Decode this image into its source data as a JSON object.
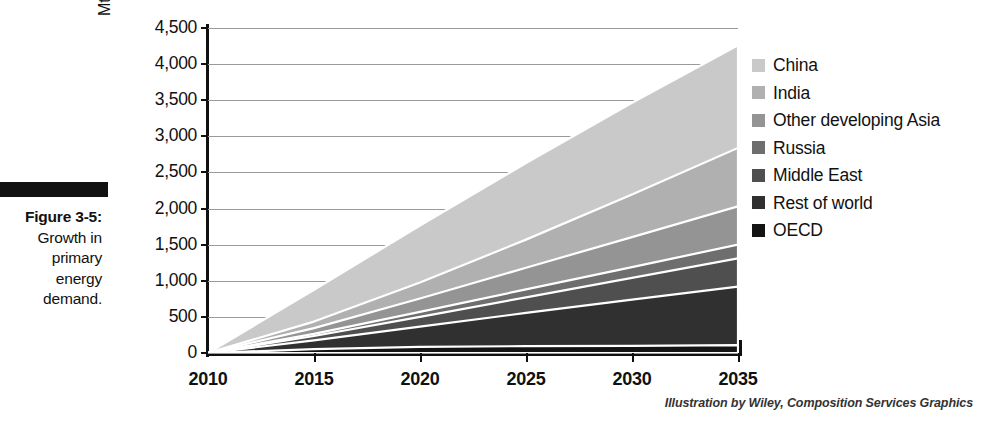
{
  "figure": {
    "number_label": "Figure 3-5:",
    "caption": "Growth in primary energy demand.",
    "caption_lines": [
      "Growth in",
      "primary",
      "energy",
      "demand."
    ],
    "credit": "Illustration by Wiley, Composition Services Graphics"
  },
  "chart_data": {
    "type": "area",
    "stacked": true,
    "title": "Growth in primary energy demand",
    "xlabel": "",
    "ylabel": "Mtoe",
    "y_axis_unit": "Mtoe",
    "x": [
      2010,
      2015,
      2020,
      2025,
      2030,
      2035
    ],
    "x_tick_labels": [
      "2010",
      "2015",
      "2020",
      "2025",
      "2030",
      "2035"
    ],
    "xlim": [
      2010,
      2035
    ],
    "ylim": [
      0,
      4500
    ],
    "y_tick_labels": [
      "0",
      "500",
      "1,000",
      "1,500",
      "2,000",
      "2,500",
      "3,000",
      "3,500",
      "4,000",
      "4,500"
    ],
    "y_ticks": [
      0,
      500,
      1000,
      1500,
      2000,
      2500,
      3000,
      3500,
      4000,
      4500
    ],
    "grid": true,
    "legend_position": "right",
    "stack_order_bottom_to_top": [
      "OECD",
      "Rest of world",
      "Middle East",
      "Russia",
      "Other developing Asia",
      "India",
      "China"
    ],
    "series": [
      {
        "name": "China",
        "color": "#c9c9c9",
        "values": [
          0,
          440,
          790,
          1060,
          1270,
          1420
        ]
      },
      {
        "name": "India",
        "color": "#b0b0b0",
        "values": [
          0,
          90,
          220,
          390,
          590,
          810
        ]
      },
      {
        "name": "Other developing Asia",
        "color": "#949494",
        "values": [
          0,
          80,
          185,
          300,
          415,
          530
        ]
      },
      {
        "name": "Russia",
        "color": "#6e6e6e",
        "values": [
          0,
          30,
          70,
          110,
          150,
          190
        ]
      },
      {
        "name": "Middle East",
        "color": "#4f4f4f",
        "values": [
          0,
          60,
          135,
          215,
          300,
          390
        ]
      },
      {
        "name": "Rest of world",
        "color": "#303030",
        "values": [
          0,
          120,
          280,
          460,
          640,
          810
        ]
      },
      {
        "name": "OECD",
        "color": "#141414",
        "values": [
          0,
          55,
          85,
          95,
          100,
          110
        ]
      }
    ],
    "totals": [
      0,
      875,
      1765,
      2630,
      3465,
      4260
    ],
    "annotations": []
  },
  "legend": {
    "items": [
      {
        "label": "China",
        "color": "#c9c9c9"
      },
      {
        "label": "India",
        "color": "#b0b0b0"
      },
      {
        "label": "Other developing Asia",
        "color": "#949494"
      },
      {
        "label": "Russia",
        "color": "#6e6e6e"
      },
      {
        "label": "Middle East",
        "color": "#4f4f4f"
      },
      {
        "label": "Rest of world",
        "color": "#303030"
      },
      {
        "label": "OECD",
        "color": "#141414"
      }
    ]
  }
}
